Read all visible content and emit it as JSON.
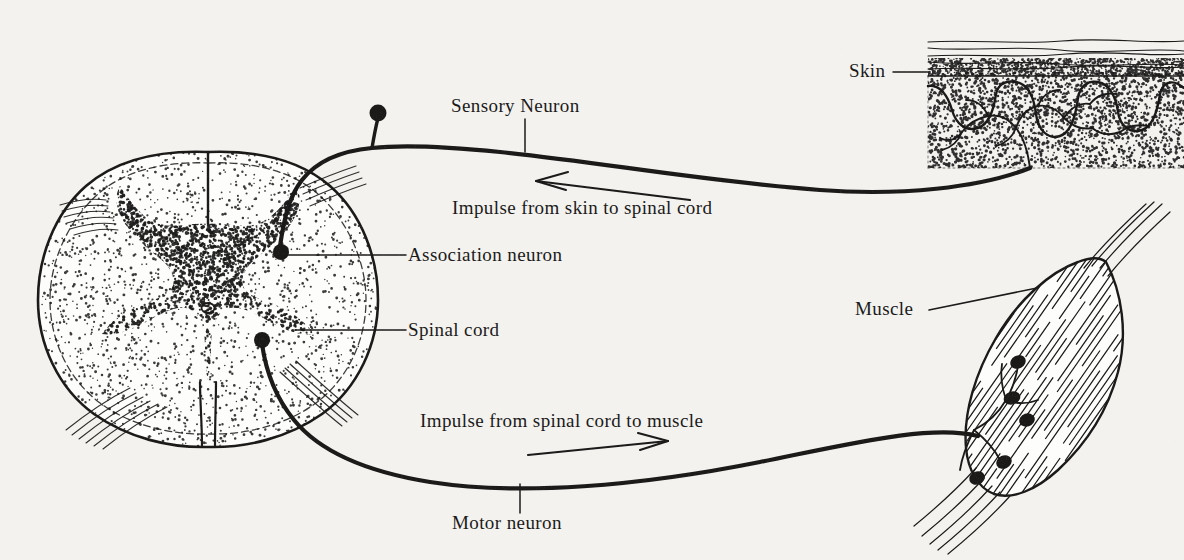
{
  "figure": {
    "background_color": "#f3f2ef",
    "ink_color": "#1b1a19"
  },
  "labels": {
    "sensory_neuron": "Sensory Neuron",
    "impulse_in": "Impulse from skin to spinal cord",
    "association_neuron": "Association neuron",
    "spinal_cord": "Spinal cord",
    "impulse_out": "Impulse from spinal cord to muscle",
    "motor_neuron": "Motor neuron",
    "skin": "Skin",
    "muscle": "Muscle"
  },
  "structures": {
    "spinal_cord_section": {
      "name": "spinal-cord-cross-section",
      "features": [
        "white-matter",
        "gray-matter-butterfly",
        "central-canal",
        "dorsal-median-fissure",
        "ventral-median-fissure",
        "nerve-root-fibers"
      ]
    },
    "skin_inset": {
      "name": "skin-cross-section",
      "features": [
        "epidermis-layers",
        "stippled-dermis",
        "sensory-nerve-endings"
      ]
    },
    "muscle_inset": {
      "name": "muscle-bundle",
      "features": [
        "striations",
        "tendon-fibers",
        "motor-end-plates"
      ],
      "end_plate_count": 5
    },
    "neurons": {
      "sensory": {
        "name": "sensory-neuron-path",
        "cell_body": "dorsal-root-ganglion"
      },
      "motor": {
        "name": "motor-neuron-path",
        "cell_body": "ventral-horn-cell"
      },
      "association": {
        "name": "association-neuron-cell-body"
      }
    }
  },
  "arrows": {
    "impulse_in_direction": "left",
    "impulse_out_direction": "right"
  }
}
